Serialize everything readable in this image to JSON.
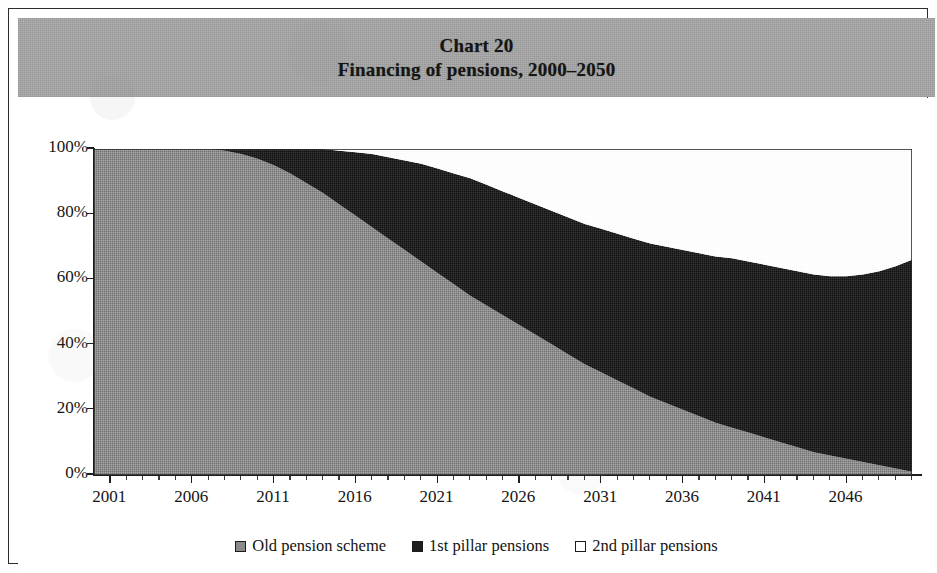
{
  "figure": {
    "title": "Chart 20",
    "subtitle": "Financing of pensions, 2000–2050",
    "title_band_color": "#a8a8a8",
    "border_color": "#2b2b2b",
    "background_color": "#ffffff"
  },
  "legend": {
    "items": [
      {
        "label": "Old pension scheme",
        "color": "#8a8a8a",
        "swatch": "legend-swatch-old-pension-scheme"
      },
      {
        "label": "1st pillar pensions",
        "color": "#1f1f1f",
        "swatch": "legend-swatch-1st-pillar-pensions"
      },
      {
        "label": "2nd pillar pensions",
        "color": "#ffffff",
        "swatch": "legend-swatch-2nd-pillar-pensions"
      }
    ]
  },
  "chart_data": {
    "type": "area",
    "stacked": true,
    "stack_mode": "percent",
    "title": "Chart 20",
    "subtitle": "Financing of pensions, 2000–2050",
    "xlabel": "",
    "ylabel": "",
    "xlim": [
      2000,
      2050
    ],
    "ylim": [
      0,
      100
    ],
    "grid": false,
    "legend_position": "bottom",
    "y_tick_labels": [
      "0%",
      "20%",
      "40%",
      "60%",
      "80%",
      "100%"
    ],
    "y_ticks": [
      0,
      20,
      40,
      60,
      80,
      100
    ],
    "x_tick_labels": [
      "2001",
      "2006",
      "2011",
      "2016",
      "2021",
      "2026",
      "2031",
      "2036",
      "2041",
      "2046"
    ],
    "x_ticks": [
      2001,
      2006,
      2011,
      2016,
      2021,
      2026,
      2031,
      2036,
      2041,
      2046
    ],
    "x_minor_tick_step": 1,
    "x": [
      2000,
      2001,
      2002,
      2003,
      2004,
      2005,
      2006,
      2007,
      2008,
      2009,
      2010,
      2011,
      2012,
      2013,
      2014,
      2015,
      2016,
      2017,
      2018,
      2019,
      2020,
      2021,
      2022,
      2023,
      2024,
      2025,
      2026,
      2027,
      2028,
      2029,
      2030,
      2031,
      2032,
      2033,
      2034,
      2035,
      2036,
      2037,
      2038,
      2039,
      2040,
      2041,
      2042,
      2043,
      2044,
      2045,
      2046,
      2047,
      2048,
      2049,
      2050
    ],
    "series": [
      {
        "name": "Old pension scheme",
        "color": "#8a8a8a",
        "values": [
          100,
          100,
          100,
          100,
          100,
          100,
          100,
          100,
          99.5,
          98.5,
          97,
          95,
          92.5,
          89.5,
          86.5,
          83,
          79.5,
          76,
          72.5,
          69,
          65.5,
          62,
          58.5,
          55,
          52,
          49,
          46,
          43,
          40,
          37,
          34,
          31.5,
          29,
          26.5,
          24,
          22,
          20,
          18,
          16,
          14.5,
          13,
          11.5,
          10,
          8.5,
          7,
          6,
          5,
          4,
          3,
          2,
          1
        ]
      },
      {
        "name": "1st pillar pensions",
        "color": "#1f1f1f",
        "values": [
          0,
          0,
          0,
          0,
          0,
          0,
          0,
          0,
          0.5,
          1.5,
          3,
          5,
          7.5,
          10.5,
          13.5,
          16.5,
          19.5,
          22.5,
          25,
          27.5,
          30,
          32,
          34,
          36,
          37,
          38,
          39,
          40,
          41,
          42,
          43,
          44,
          45,
          46,
          47,
          48,
          49,
          50,
          51,
          52,
          52.5,
          53,
          53.5,
          54,
          54.5,
          55,
          56,
          57.5,
          59.5,
          62,
          65
        ]
      },
      {
        "name": "2nd pillar pensions",
        "color": "#ffffff",
        "values": [
          0,
          0,
          0,
          0,
          0,
          0,
          0,
          0,
          0,
          0,
          0,
          0,
          0,
          0,
          0,
          0.5,
          1,
          1.5,
          2.5,
          3.5,
          4.5,
          6,
          7.5,
          9,
          11,
          13,
          15,
          17,
          19,
          21,
          23,
          24.5,
          26,
          27.5,
          29,
          30,
          31,
          32,
          33,
          33.5,
          34.5,
          35.5,
          36.5,
          37.5,
          38.5,
          39,
          39,
          38.5,
          37.5,
          36,
          34
        ]
      }
    ]
  }
}
